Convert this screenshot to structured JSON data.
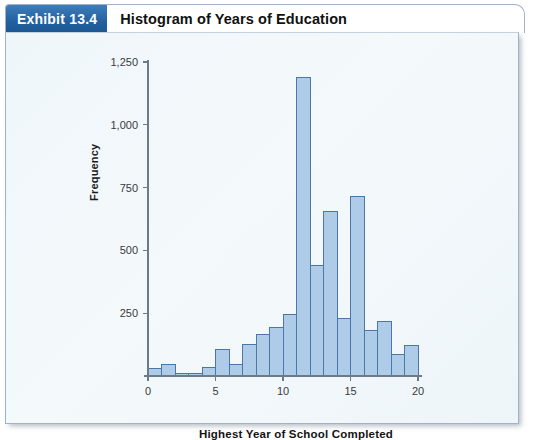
{
  "exhibit": {
    "badge_label": "Exhibit 13.4",
    "title": "Histogram of Years of Education",
    "badge_color": "#22609f",
    "panel_background": "#eff6fa",
    "border_color": "#9fb3c6"
  },
  "chart_data": {
    "type": "bar",
    "title": "Histogram of Years of Education",
    "xlabel": "Highest Year of School Completed",
    "ylabel": "Frequency",
    "xlim": [
      0,
      20
    ],
    "ylim": [
      0,
      1250
    ],
    "xticks": [
      0,
      5,
      10,
      15,
      20
    ],
    "xtick_labels": [
      "0",
      "5",
      "10",
      "15",
      "20"
    ],
    "yticks": [
      250,
      500,
      750,
      1000,
      1250
    ],
    "ytick_labels": [
      "250",
      "500",
      "750",
      "1,000",
      "1,250"
    ],
    "grid": false,
    "legend": null,
    "bin_width": 1,
    "bar_fill": "#aecbe8",
    "bar_stroke": "#4a77a8",
    "categories": [
      "0-1",
      "1-2",
      "2-3",
      "3-4",
      "4-5",
      "5-6",
      "6-7",
      "7-8",
      "8-9",
      "9-10",
      "10-11",
      "11-12",
      "12-13",
      "13-14",
      "14-15",
      "15-16",
      "16-17",
      "17-18",
      "18-19",
      "19-20"
    ],
    "bin_starts": [
      0,
      1,
      2,
      3,
      4,
      5,
      6,
      7,
      8,
      9,
      10,
      11,
      12,
      13,
      14,
      15,
      16,
      17,
      18,
      19
    ],
    "values": [
      30,
      45,
      8,
      10,
      35,
      105,
      45,
      125,
      165,
      195,
      245,
      1190,
      440,
      655,
      230,
      715,
      180,
      215,
      85,
      120
    ]
  }
}
